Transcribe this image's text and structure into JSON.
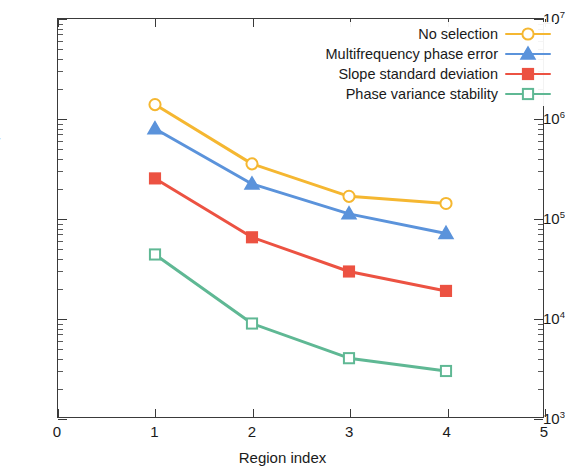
{
  "chart_data": {
    "type": "line",
    "title": "",
    "xlabel": "Region index",
    "ylabel_main": "Number of selected PS",
    "ylabel_sub": "r",
    "yscale": "log",
    "xlim": [
      0,
      5
    ],
    "ylim": [
      1000,
      10000000
    ],
    "grid": false,
    "legend_position": "top-right",
    "x": [
      1,
      2,
      3,
      4
    ],
    "xticks": [
      "0",
      "1",
      "2",
      "3",
      "4",
      "5"
    ],
    "yticks": [
      "10",
      "10",
      "10",
      "10",
      "10"
    ],
    "ytick_exponents": [
      "3",
      "4",
      "5",
      "6",
      "7"
    ],
    "series": [
      {
        "name": "No selection",
        "color": "#F5B731",
        "marker": "circle",
        "filled": false,
        "values": [
          1380000,
          350000,
          165000,
          140000
        ]
      },
      {
        "name": "Multifrequency phase error",
        "color": "#5B93DB",
        "marker": "triangle",
        "filled": true,
        "values": [
          790000,
          220000,
          110000,
          70000
        ]
      },
      {
        "name": "Slope standard deviation",
        "color": "#EC5242",
        "marker": "square",
        "filled": true,
        "values": [
          250000,
          64000,
          29000,
          18500
        ]
      },
      {
        "name": "Phase variance stability",
        "color": "#5FB894",
        "marker": "square",
        "filled": false,
        "values": [
          43000,
          8700,
          3900,
          2900
        ]
      }
    ]
  }
}
